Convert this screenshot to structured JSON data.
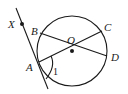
{
  "diagram": {
    "type": "geometry",
    "colors": {
      "stroke": "#1a1a1a",
      "background": "#ffffff"
    },
    "circle": {
      "center_label": "O",
      "cx": 72,
      "cy": 51,
      "r": 35
    },
    "points": [
      {
        "label": "X",
        "x": 22,
        "y": 24,
        "lx": 8,
        "ly": 28,
        "dot": true
      },
      {
        "label": "B",
        "x": 40,
        "y": 33,
        "lx": 31,
        "ly": 35,
        "dot": false
      },
      {
        "label": "O",
        "x": 72,
        "y": 51,
        "lx": 67,
        "ly": 44,
        "dot": true
      },
      {
        "label": "C",
        "x": 102,
        "y": 31,
        "lx": 104,
        "ly": 31,
        "dot": false
      },
      {
        "label": "D",
        "x": 107,
        "y": 56,
        "lx": 111,
        "ly": 61,
        "dot": false
      },
      {
        "label": "A",
        "x": 39,
        "y": 62,
        "lx": 26,
        "ly": 71,
        "dot": false
      }
    ],
    "segments": [
      {
        "name": "tangent-line-XA",
        "from": [
          16,
          8
        ],
        "to": [
          48,
          89
        ]
      },
      {
        "name": "segment-BD",
        "from": "B",
        "to": "D"
      },
      {
        "name": "segment-AC",
        "from": "A",
        "to": "C"
      }
    ],
    "angle": {
      "label": "1",
      "vertex": "A",
      "lx": 53,
      "ly": 75
    }
  }
}
